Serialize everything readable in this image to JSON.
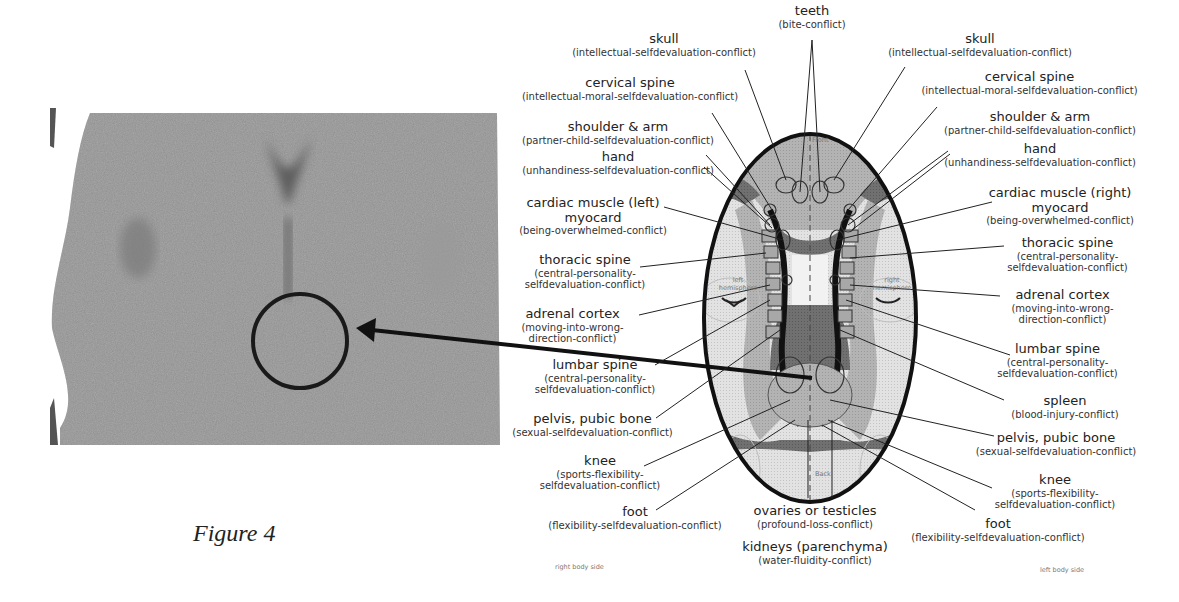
{
  "figure": {
    "caption": "Figure 4"
  },
  "scan": {
    "description": "brain CT scan, horizontal slice",
    "highlight": "circle around central region with arrow from diagram"
  },
  "diagram": {
    "orientation": {
      "front": "Front",
      "back": "Back",
      "left_hemisphere": "left hemisphere",
      "right_hemisphere": "right hemisphere",
      "right_body_side": "right body side",
      "left_body_side": "left body side"
    },
    "top_center": {
      "title": "teeth",
      "sub": "(bite-conflict)"
    },
    "bottom_center": [
      {
        "title": "ovaries or testicles",
        "sub": "(profound-loss-conflict)"
      },
      {
        "title": "kidneys (parenchyma)",
        "sub": "(water-fluidity-conflict)"
      }
    ],
    "left_labels": [
      {
        "title": "skull",
        "sub": "(intellectual-selfdevaluation-conflict)"
      },
      {
        "title": "cervical spine",
        "sub": "(intellectual-moral-selfdevaluation-conflict)"
      },
      {
        "title": "shoulder & arm",
        "sub": "(partner-child-selfdevaluation-conflict)"
      },
      {
        "title": "hand",
        "sub": "(unhandiness-selfdevaluation-conflict)"
      },
      {
        "title": "cardiac muscle (left)",
        "title2": "myocard",
        "sub": "(being-overwhelmed-conflict)"
      },
      {
        "title": "thoracic spine",
        "sub": "(central-personality-",
        "sub2": "selfdevaluation-conflict)"
      },
      {
        "title": "adrenal cortex",
        "sub": "(moving-into-wrong-",
        "sub2": "direction-conflict)"
      },
      {
        "title": "lumbar spine",
        "sub": "(central-personality-",
        "sub2": "selfdevaluation-conflict)"
      },
      {
        "title": "pelvis, pubic bone",
        "sub": "(sexual-selfdevaluation-conflict)"
      },
      {
        "title": "knee",
        "sub": "(sports-flexibility-",
        "sub2": "selfdevaluation-conflict)"
      },
      {
        "title": "foot",
        "sub": "(flexibility-selfdevaluation-conflict)"
      }
    ],
    "right_labels": [
      {
        "title": "skull",
        "sub": "(intellectual-selfdevaluation-conflict)"
      },
      {
        "title": "cervical spine",
        "sub": "(intellectual-moral-selfdevaluation-conflict)"
      },
      {
        "title": "shoulder & arm",
        "sub": "(partner-child-selfdevaluation-conflict)"
      },
      {
        "title": "hand",
        "sub": "(unhandiness-selfdevaluation-conflict)"
      },
      {
        "title": "cardiac muscle (right)",
        "title2": "myocard",
        "sub": "(being-overwhelmed-conflict)"
      },
      {
        "title": "thoracic spine",
        "sub": "(central-personality-",
        "sub2": "selfdevaluation-conflict)"
      },
      {
        "title": "adrenal cortex",
        "sub": "(moving-into-wrong-",
        "sub2": "direction-conflict)"
      },
      {
        "title": "lumbar spine",
        "sub": "(central-personality-",
        "sub2": "selfdevaluation-conflict)"
      },
      {
        "title": "spleen",
        "sub": "(blood-injury-conflict)"
      },
      {
        "title": "pelvis, pubic bone",
        "sub": "(sexual-selfdevaluation-conflict)"
      },
      {
        "title": "knee",
        "sub": "(sports-flexibility-",
        "sub2": "selfdevaluation-conflict)"
      },
      {
        "title": "foot",
        "sub": "(flexibility-selfdevaluation-conflict)"
      }
    ]
  },
  "colors": {
    "outline": "#1a1a1a",
    "light_gray": "#d4d4d4",
    "mid_gray": "#a8a8a8",
    "dark_gray": "#6e6e6e",
    "scan_gray": "#8c8c8c"
  }
}
